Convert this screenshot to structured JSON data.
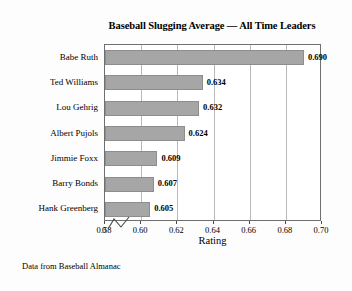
{
  "chart_data": {
    "type": "bar",
    "orientation": "horizontal",
    "title": "Baseball Slugging Average — All Time Leaders",
    "xlabel": "Rating",
    "ylabel": "",
    "categories": [
      "Babe Ruth",
      "Ted Williams",
      "Lou Gehrig",
      "Albert Pujols",
      "Jimmie Foxx",
      "Barry Bonds",
      "Hank Greenberg"
    ],
    "values": [
      0.69,
      0.634,
      0.632,
      0.624,
      0.609,
      0.607,
      0.605
    ],
    "value_labels": [
      "0.690",
      "0.634",
      "0.632",
      "0.624",
      "0.609",
      "0.607",
      "0.605"
    ],
    "xlim": [
      0.58,
      0.7
    ],
    "axis_break": true,
    "axis_break_note": "x-axis broken between 0 and 0.58",
    "xticks": [
      0,
      0.58,
      0.6,
      0.62,
      0.64,
      0.66,
      0.68,
      0.7
    ],
    "xtick_labels": [
      "0",
      "0.58",
      "0.60",
      "0.62",
      "0.64",
      "0.66",
      "0.68",
      "0.70"
    ],
    "grid": "vertical",
    "legend": "none",
    "bar_color": "#a6a6a6",
    "bar_edge_color": "#8d8d8d",
    "frame_color": "#6f6f6f",
    "gridline_color": "#b9b9b9",
    "background_color": "#fdfdfd",
    "annotation": "Data from Baseball Almanac"
  },
  "footnote": "Data from Baseball Almanac"
}
